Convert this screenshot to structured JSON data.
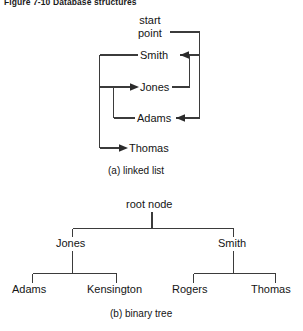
{
  "figure": {
    "title": "Figure 7-10  Database structures",
    "background_color": "#ffffff",
    "line_color": "#3b3b3b"
  },
  "linked_list": {
    "caption": "(a) linked list",
    "start_label_line1": "start",
    "start_label_line2": "point",
    "nodes": [
      {
        "label": "Smith",
        "order": 1,
        "x": 140,
        "y": 55
      },
      {
        "label": "Jones",
        "order": 2,
        "x": 140,
        "y": 87
      },
      {
        "label": "Adams",
        "order": 3,
        "x": 137,
        "y": 118
      },
      {
        "label": "Thomas",
        "order": 4,
        "x": 129,
        "y": 148
      }
    ],
    "traversal_order": [
      "start point",
      "Smith",
      "Jones",
      "Adams",
      "Thomas"
    ]
  },
  "binary_tree": {
    "caption": "(b) binary tree",
    "root": {
      "label": "root node",
      "x": 152,
      "y": 204
    },
    "level2": [
      {
        "label": "Jones",
        "side": "left",
        "x": 72,
        "y": 243
      },
      {
        "label": "Smith",
        "side": "right",
        "x": 233,
        "y": 243
      }
    ],
    "level3": [
      {
        "label": "Adams",
        "parent": "Jones",
        "side": "left",
        "x": 32,
        "y": 289
      },
      {
        "label": "Kensington",
        "parent": "Jones",
        "side": "right",
        "x": 116,
        "y": 289
      },
      {
        "label": "Rogers",
        "parent": "Smith",
        "side": "left",
        "x": 193,
        "y": 289
      },
      {
        "label": "Thomas",
        "parent": "Smith",
        "side": "right",
        "x": 275,
        "y": 289
      }
    ]
  }
}
